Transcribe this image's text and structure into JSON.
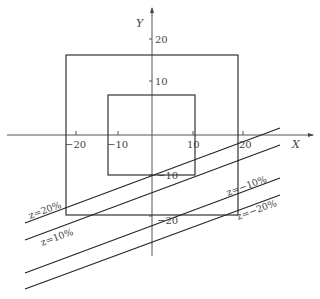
{
  "diagram": {
    "axes": {
      "x_label": "X",
      "y_label": "Y",
      "x_ticks": [
        "−20",
        "−10",
        "10",
        "20"
      ],
      "y_ticks": [
        "20",
        "10",
        "−10",
        "−20"
      ]
    },
    "rectangles": [
      {
        "name": "outer",
        "x_range": [
          -20,
          20
        ],
        "y_range": [
          -20,
          19
        ]
      },
      {
        "name": "inner",
        "x_range": [
          -10,
          10
        ],
        "y_range": [
          -10,
          10
        ]
      }
    ],
    "lines": [
      {
        "label": "z=20%"
      },
      {
        "label": "z=10%"
      },
      {
        "label": "z=−10%"
      },
      {
        "label": "z=−20%"
      }
    ]
  }
}
